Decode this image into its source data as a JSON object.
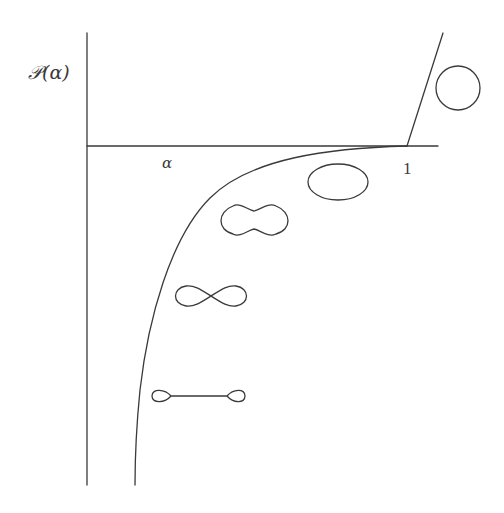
{
  "diagram": {
    "y_axis_label": "𝒫(α)",
    "x_axis_label": "α",
    "x_tick_label": "1",
    "shapes": [
      {
        "name": "circle",
        "region": "above axis, right of alpha=1"
      },
      {
        "name": "ellipse",
        "region": "just below axis near alpha=1"
      },
      {
        "name": "peanut",
        "region": "below curve, mid"
      },
      {
        "name": "figure-eight",
        "region": "below curve, lower"
      },
      {
        "name": "dumbbell",
        "region": "below curve, lowest"
      }
    ],
    "stroke_color": "#3a3a3a",
    "background": "#ffffff"
  }
}
